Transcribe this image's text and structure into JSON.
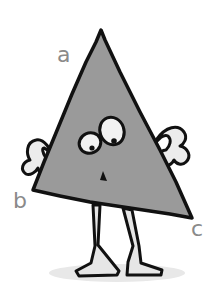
{
  "illustration": {
    "subject": "cartoon triangle character with arms, legs, and eyes",
    "vertex_labels": {
      "top": "a",
      "bottom_left": "b",
      "bottom_right": "c"
    },
    "colors": {
      "triangle_fill": "#9a9a9a",
      "outline": "#111111",
      "label": "#8a8a8a",
      "legs_fill": "#e6e6e6",
      "shadow": "#e8e8e8",
      "eye_fill": "#f2f2f2",
      "background": "#ffffff"
    }
  }
}
